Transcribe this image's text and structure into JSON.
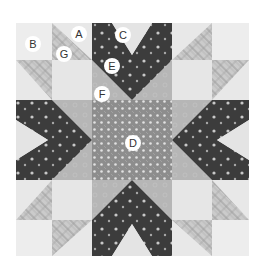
{
  "diagram": {
    "type": "quilt-block",
    "colors": {
      "background_light": "#e8e8e8",
      "corner_light": "#ededed",
      "plaid": "#c9c9c9",
      "plaid_lines": "#8a8a8a",
      "dark_dotted": "#3c3c3c",
      "medium_gray": "#b4b4b4",
      "center_print": "#8f8f8f",
      "dot": "#d0d0d0"
    },
    "labels": [
      {
        "id": "A",
        "text": "A",
        "x": 79,
        "y": 34
      },
      {
        "id": "B",
        "text": "B",
        "x": 33,
        "y": 44
      },
      {
        "id": "C",
        "text": "C",
        "x": 123,
        "y": 35
      },
      {
        "id": "D",
        "text": "D",
        "x": 133,
        "y": 143
      },
      {
        "id": "E",
        "text": "E",
        "x": 112,
        "y": 66
      },
      {
        "id": "F",
        "text": "F",
        "x": 102,
        "y": 94
      },
      {
        "id": "G",
        "text": "G",
        "x": 64,
        "y": 54
      }
    ]
  }
}
